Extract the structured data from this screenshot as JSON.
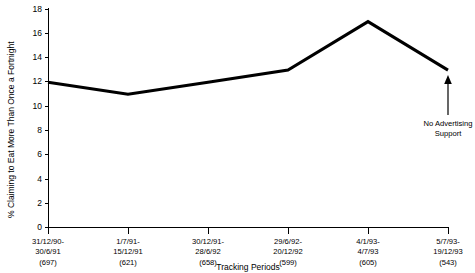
{
  "chart_data": {
    "type": "line",
    "title": "",
    "subtitle": "",
    "xlabel": "Tracking Periods",
    "ylabel": "% Claiming to Eat More Than Once a Fortnight",
    "ylim": [
      0,
      18
    ],
    "ytick_values": [
      0,
      2,
      4,
      6,
      8,
      10,
      12,
      14,
      16,
      18
    ],
    "ytick_labels": [
      "0",
      "2",
      "4",
      "6",
      "8",
      "10",
      "12",
      "14",
      "16",
      "18"
    ],
    "grid": false,
    "legend": false,
    "legend_position": "none",
    "categories": [
      "31/12/90-\n30/6/91\n(697)",
      "1/7/91-\n15/12/91\n(621)",
      "30/12/91-\n28/6/92\n(658)",
      "29/6/92-\n20/12/92\n(599)",
      "4/1/93-\n4/7/93\n(605)",
      "5/7/93-\n19/12/93\n(543)"
    ],
    "category_lines": [
      [
        "31/12/90-",
        "30/6/91",
        "(697)"
      ],
      [
        "1/7/91-",
        "15/12/91",
        "(621)"
      ],
      [
        "30/12/91-",
        "28/6/92",
        "(658)"
      ],
      [
        "29/6/92-",
        "20/12/92",
        "(599)"
      ],
      [
        "4/1/93-",
        "4/7/93",
        "(605)"
      ],
      [
        "5/7/93-",
        "19/12/93",
        "(543)"
      ]
    ],
    "sample_sizes": [
      697,
      621,
      658,
      599,
      605,
      543
    ],
    "values": [
      12,
      11,
      12,
      13,
      17,
      13
    ],
    "series": [
      {
        "name": "% Claiming to Eat More Than Once a Fortnight",
        "values": [
          12,
          11,
          12,
          13,
          17,
          13
        ],
        "color": "#000000"
      }
    ],
    "annotations": [
      {
        "text_lines": [
          "No Advertising",
          "Support"
        ],
        "text": "No Advertising Support",
        "points_to_category_index": 5,
        "points_to_value": 13
      }
    ],
    "colors": {
      "line": "#000000",
      "axis": "#000000",
      "text": "#000000",
      "background": "#ffffff"
    }
  }
}
